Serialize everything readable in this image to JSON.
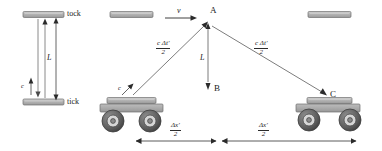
{
  "figure": {
    "width": 382,
    "height": 151,
    "background": "#ffffff",
    "ink": "#2b2b2b",
    "mirror_fill": "#b0b0b0",
    "cart_body_fill": "#a8a8a8",
    "wheel_fill": "#6e6e6e"
  },
  "rest_clock": {
    "top_mirror_label": "tock",
    "bottom_mirror_label": "tick",
    "height_label": "L",
    "light_speed_label": "c"
  },
  "moving_frame": {
    "velocity_label": "v",
    "apex_label": "A",
    "bottom_label": "B",
    "right_event_label": "C",
    "vertical_length_label": "L",
    "light_speed_label": "c",
    "light_path_left": {
      "numerator": "c Δt′",
      "denominator": "2"
    },
    "light_path_right": {
      "numerator": "c Δt′",
      "denominator": "2"
    },
    "displacement_left": {
      "numerator": "Δx′",
      "denominator": "2"
    },
    "displacement_right": {
      "numerator": "Δx′",
      "denominator": "2"
    }
  }
}
